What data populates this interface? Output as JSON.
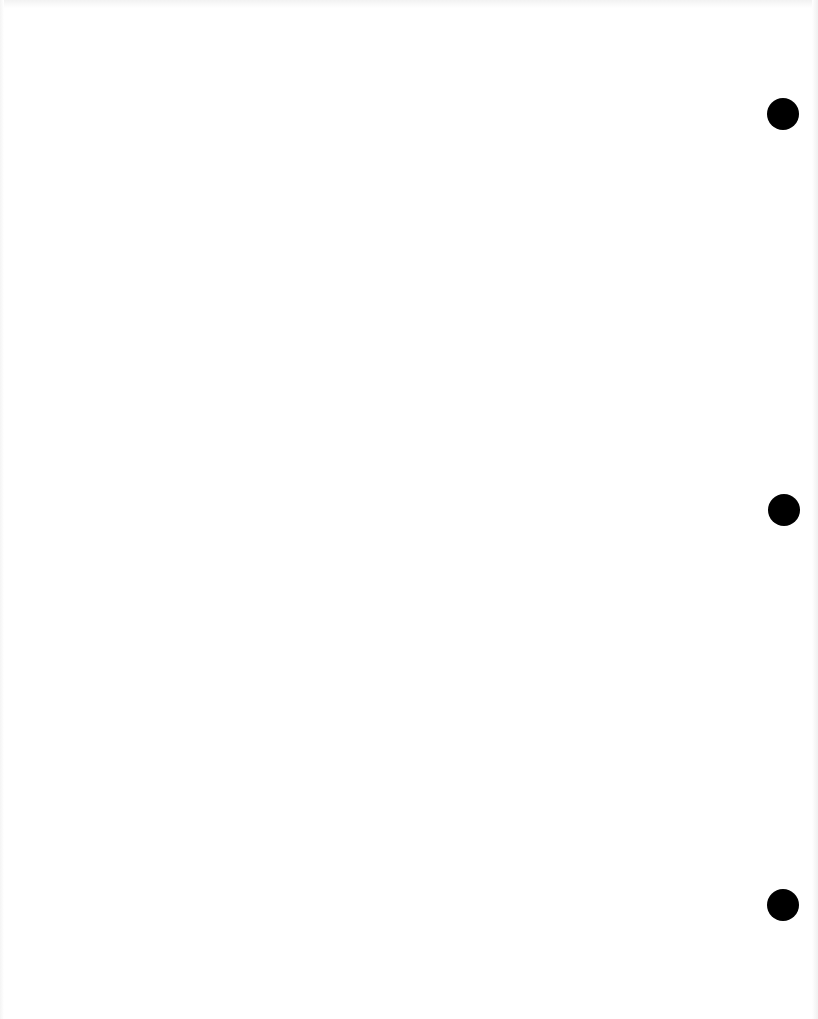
{
  "page": {
    "type": "blank-scanned-sheet",
    "background_color": "#ffffff"
  },
  "punch_holes": [
    {
      "cx": 783,
      "cy": 114,
      "diameter": 32,
      "color": "#000000"
    },
    {
      "cx": 784,
      "cy": 510,
      "diameter": 32,
      "color": "#000000"
    },
    {
      "cx": 783,
      "cy": 905,
      "diameter": 32,
      "color": "#000000"
    }
  ]
}
